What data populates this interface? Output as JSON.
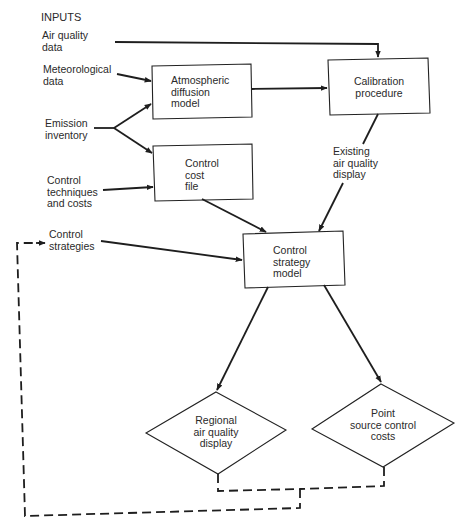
{
  "diagram": {
    "heading": "INPUTS",
    "inputs": [
      {
        "id": "air-quality-data",
        "label": "Air quality\ndata"
      },
      {
        "id": "meteorological-data",
        "label": "Meteorological\ndata"
      },
      {
        "id": "emission-inventory",
        "label": "Emission\ninventory"
      },
      {
        "id": "control-techniques",
        "label": "Control\ntechniques\nand costs"
      },
      {
        "id": "control-strategies",
        "label": "Control\nstrategies"
      }
    ],
    "processes": [
      {
        "id": "atmospheric-diffusion-model",
        "label": "Atmospheric\ndiffusion\nmodel"
      },
      {
        "id": "calibration-procedure",
        "label": "Calibration\nprocedure"
      },
      {
        "id": "control-cost-file",
        "label": "Control\ncost\nfile"
      },
      {
        "id": "control-strategy-model",
        "label": "Control\nstrategy\nmodel"
      }
    ],
    "intermediate_labels": [
      {
        "id": "existing-air-quality-display",
        "label": "Existing\nair quality\ndisplay"
      }
    ],
    "outputs": [
      {
        "id": "regional-air-quality-display",
        "label": "Regional\nair quality\ndisplay"
      },
      {
        "id": "point-source-control-costs",
        "label": "Point\nsource control\ncosts"
      }
    ],
    "edges": [
      {
        "from": "Air quality data",
        "to": "Calibration procedure",
        "style": "solid"
      },
      {
        "from": "Meteorological data",
        "to": "Atmospheric diffusion model",
        "style": "solid"
      },
      {
        "from": "Emission inventory",
        "to": "Atmospheric diffusion model",
        "style": "solid"
      },
      {
        "from": "Emission inventory",
        "to": "Control cost file",
        "style": "solid"
      },
      {
        "from": "Control techniques and costs",
        "to": "Control cost file",
        "style": "solid"
      },
      {
        "from": "Atmospheric diffusion model",
        "to": "Calibration procedure",
        "style": "solid"
      },
      {
        "from": "Calibration procedure",
        "to": "Control strategy model",
        "via": "Existing air quality display",
        "style": "solid"
      },
      {
        "from": "Control cost file",
        "to": "Control strategy model",
        "style": "solid"
      },
      {
        "from": "Control strategies",
        "to": "Control strategy model",
        "style": "solid"
      },
      {
        "from": "Control strategy model",
        "to": "Regional air quality display",
        "style": "solid"
      },
      {
        "from": "Control strategy model",
        "to": "Point source control costs",
        "style": "solid"
      },
      {
        "from": "Regional air quality display + Point source control costs",
        "to": "Control strategies",
        "style": "dashed",
        "note": "feedback loop"
      }
    ],
    "colors": {
      "ink": "#2a2a2a",
      "background": "#ffffff"
    }
  }
}
